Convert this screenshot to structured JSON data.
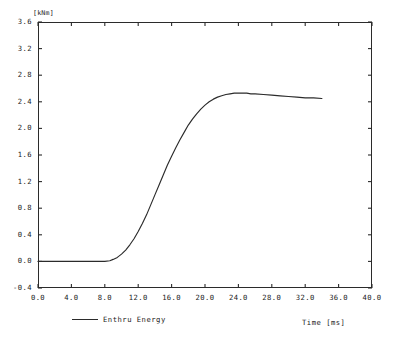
{
  "chart_data": {
    "type": "line",
    "title": "",
    "subtitle": "",
    "xlabel": "Time  [ms]",
    "ylabel": "[kNm]",
    "ylim": [
      -0.4,
      3.6
    ],
    "xlim": [
      0.0,
      40.0
    ],
    "grid": false,
    "legend_position": "bottom-left",
    "y_unit": "[kNm]",
    "x_unit": "[ms]",
    "xticks": [
      "0.0",
      "4.0",
      "8.0",
      "12.0",
      "16.0",
      "20.0",
      "24.0",
      "28.0",
      "32.0",
      "36.0",
      "40.0"
    ],
    "xtick_values": [
      0,
      4,
      8,
      12,
      16,
      20,
      24,
      28,
      32,
      36,
      40
    ],
    "yticks": [
      "3.6",
      "3.2",
      "2.8",
      "2.4",
      "2.0",
      "1.6",
      "1.2",
      "0.8",
      "0.4",
      "0.0",
      "-0.4"
    ],
    "ytick_values": [
      3.6,
      3.2,
      2.8,
      2.4,
      2.0,
      1.6,
      1.2,
      0.8,
      0.4,
      0.0,
      -0.4
    ],
    "series": [
      {
        "name": "Enthru Energy",
        "color": "#2b2b2b",
        "x": [
          0.0,
          1.0,
          2.0,
          3.0,
          4.0,
          5.0,
          6.0,
          7.0,
          8.0,
          8.6,
          9.0,
          9.5,
          10.0,
          10.5,
          11.0,
          11.5,
          12.0,
          12.5,
          13.0,
          13.5,
          14.0,
          14.5,
          15.0,
          15.5,
          16.0,
          16.5,
          17.0,
          17.5,
          18.0,
          18.5,
          19.0,
          19.5,
          20.0,
          20.5,
          21.0,
          21.5,
          22.0,
          22.5,
          23.0,
          23.5,
          24.0,
          24.5,
          25.0,
          25.5,
          26.0,
          27.0,
          28.0,
          29.0,
          30.0,
          31.0,
          32.0,
          33.0,
          34.0
        ],
        "y": [
          0.0,
          0.0,
          0.0,
          0.0,
          0.0,
          0.0,
          0.0,
          0.0,
          0.0,
          0.01,
          0.03,
          0.06,
          0.11,
          0.17,
          0.25,
          0.34,
          0.45,
          0.57,
          0.7,
          0.85,
          1.0,
          1.15,
          1.3,
          1.45,
          1.58,
          1.71,
          1.83,
          1.94,
          2.05,
          2.14,
          2.22,
          2.29,
          2.35,
          2.4,
          2.44,
          2.47,
          2.49,
          2.51,
          2.52,
          2.53,
          2.53,
          2.53,
          2.53,
          2.52,
          2.52,
          2.51,
          2.5,
          2.49,
          2.48,
          2.47,
          2.46,
          2.46,
          2.45
        ]
      }
    ]
  },
  "legend": {
    "entries": [
      {
        "label": "Enthru Energy"
      }
    ]
  },
  "axes": {
    "y_unit_label": "[kNm]",
    "x_title_label": "Time  [ms]"
  }
}
